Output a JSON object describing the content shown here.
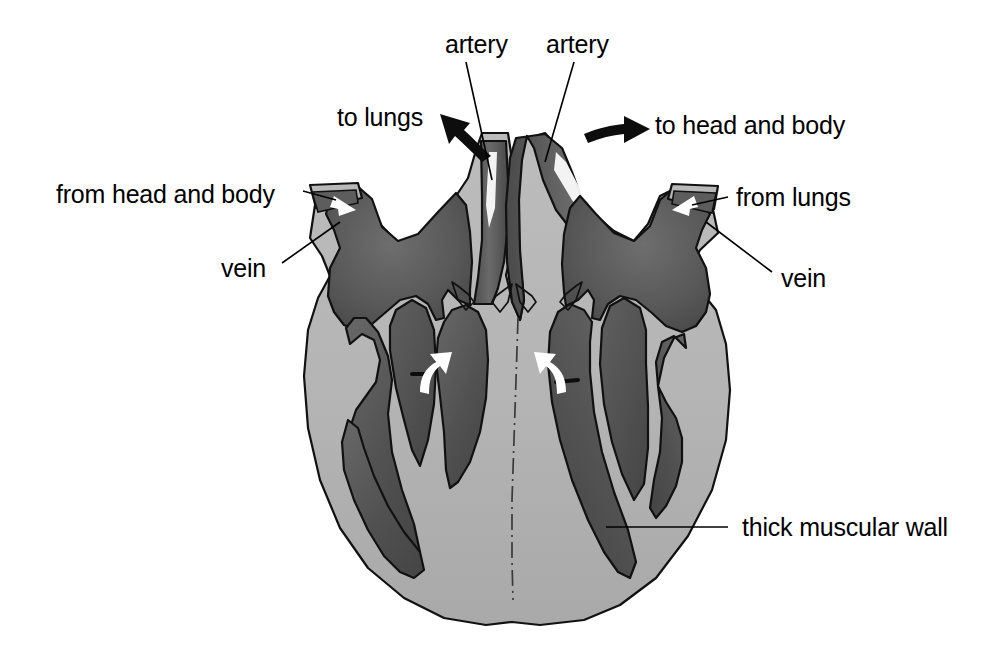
{
  "figure": {
    "type": "anatomical-diagram",
    "background_color": "#ffffff"
  },
  "colors": {
    "muscle_wall": "#b4b4b4",
    "chamber_dark": "#555555",
    "chamber_dark_mid": "#636363",
    "vessel_lumen": "#5a5a5a",
    "outline": "#111111",
    "label_text": "#000000",
    "arrow_white": "#ffffff",
    "arrow_black": "#0d0d0d"
  },
  "labels": {
    "artery_left": "artery",
    "artery_right": "artery",
    "to_lungs": "to lungs",
    "to_head_and_body": "to head and body",
    "from_head_and_body": "from head and body",
    "from_lungs": "from lungs",
    "vein_left": "vein",
    "vein_right": "vein",
    "thick_muscular_wall": "thick muscular wall"
  },
  "flow_arrows": {
    "to_lungs": "black arrow pointing up-left out of pulmonary artery",
    "to_head_and_body": "black arrow pointing right out of aorta",
    "from_head_and_body": "white arrow pointing right into right atrium",
    "from_lungs": "white arrow pointing left into left atrium",
    "right_ventricle_up": "white curved arrow pointing up through valve",
    "left_ventricle_up": "white curved arrow pointing up through valve",
    "pulmonary_outflow": "white streak in pulmonary artery",
    "aortic_outflow": "white streak in aorta"
  }
}
